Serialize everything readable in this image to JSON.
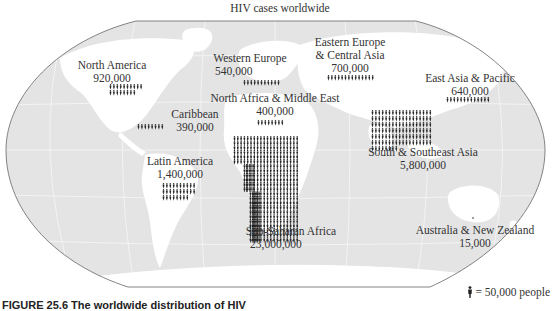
{
  "chart_data": {
    "type": "pictograph-map",
    "title": "HIV cases worldwide",
    "unit": "people",
    "icon_value": 50000,
    "legend": "= 50,000 people",
    "regions": [
      {
        "name": "North America",
        "value": 920000,
        "label": "920,000"
      },
      {
        "name": "Caribbean",
        "value": 390000,
        "label": "390,000"
      },
      {
        "name": "Latin America",
        "value": 1400000,
        "label": "1,400,000"
      },
      {
        "name": "Western Europe",
        "value": 540000,
        "label": "540,000"
      },
      {
        "name": "Eastern Europe & Central Asia",
        "value": 700000,
        "label": "700,000"
      },
      {
        "name": "North Africa & Middle East",
        "value": 400000,
        "label": "400,000"
      },
      {
        "name": "Sub-Saharan Africa",
        "value": 23000000,
        "label": "23,000,000"
      },
      {
        "name": "East Asia & Pacific",
        "value": 640000,
        "label": "640,000"
      },
      {
        "name": "South & Southeast Asia",
        "value": 5800000,
        "label": "5,800,000"
      },
      {
        "name": "Australia & New Zealand",
        "value": 15000,
        "label": "15,000"
      }
    ]
  },
  "title": "HIV cases worldwide",
  "labels": {
    "north_america": {
      "name": "North America",
      "value": "920,000"
    },
    "caribbean": {
      "name": "Caribbean",
      "value": "390,000"
    },
    "latin_america": {
      "name": "Latin America",
      "value": "1,400,000"
    },
    "western_europe": {
      "name": "Western Europe",
      "value": "540,000"
    },
    "eastern_europe_1": "Eastern Europe",
    "eastern_europe_2": "& Central Asia",
    "eastern_europe_value": "700,000",
    "north_africa": {
      "name": "North Africa & Middle East",
      "value": "400,000"
    },
    "sub_saharan": {
      "name": "Sub-Saharan Africa",
      "value": "23,000,000"
    },
    "east_asia": {
      "name": "East Asia & Pacific",
      "value": "640,000"
    },
    "south_asia": {
      "name": "South & Southeast Asia",
      "value": "5,800,000"
    },
    "australia": {
      "name": "Australia & New Zealand",
      "value": "15,000"
    }
  },
  "legend": {
    "text": "= 50,000 people"
  },
  "caption": "FIGURE 25.6  The worldwide distribution of HIV"
}
